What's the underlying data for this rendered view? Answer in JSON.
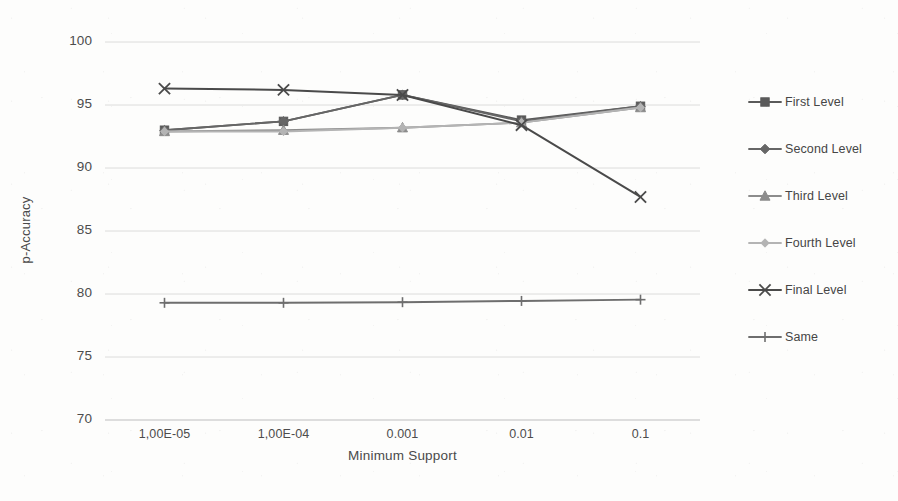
{
  "chart_data": {
    "type": "line",
    "title": "",
    "xlabel": "Minimum Support",
    "ylabel": "p-Accuracy",
    "categories": [
      "1,00E-05",
      "1,00E-04",
      "0.001",
      "0.01",
      "0.1"
    ],
    "ylim": [
      70,
      100
    ],
    "yticks": [
      70,
      75,
      80,
      85,
      90,
      95,
      100
    ],
    "grid": "horizontal",
    "legend_position": "right",
    "series": [
      {
        "name": "First Level",
        "marker": "square",
        "color": "#5a5a5a",
        "values": [
          93.0,
          93.7,
          95.8,
          93.8,
          94.9
        ]
      },
      {
        "name": "Second Level",
        "marker": "diamond",
        "color": "#666666",
        "values": [
          93.0,
          93.7,
          95.8,
          93.7,
          94.9
        ]
      },
      {
        "name": "Third Level",
        "marker": "triangle",
        "color": "#8c8c8c",
        "values": [
          92.9,
          93.0,
          93.2,
          93.6,
          94.8
        ]
      },
      {
        "name": "Fourth Level",
        "marker": "diamond-light",
        "color": "#b4b4b4",
        "values": [
          92.9,
          92.9,
          93.2,
          93.6,
          94.8
        ]
      },
      {
        "name": "Final Level",
        "marker": "x",
        "color": "#4a4a4a",
        "values": [
          96.3,
          96.2,
          95.8,
          93.4,
          87.7
        ]
      },
      {
        "name": "Same",
        "marker": "plus",
        "color": "#6e6e6e",
        "values": [
          79.3,
          79.3,
          79.35,
          79.45,
          79.55
        ]
      }
    ]
  },
  "legend": {
    "items": [
      {
        "label": "First Level"
      },
      {
        "label": "Second Level"
      },
      {
        "label": "Third Level"
      },
      {
        "label": "Fourth Level"
      },
      {
        "label": "Final Level"
      },
      {
        "label": "Same"
      }
    ]
  },
  "axes": {
    "y_title": "p-Accuracy",
    "x_title": "Minimum Support",
    "y_tick_labels": [
      "100",
      "95",
      "90",
      "85",
      "80",
      "75",
      "70"
    ],
    "x_tick_labels": [
      "1,00E-05",
      "1,00E-04",
      "0.001",
      "0.01",
      "0.1"
    ]
  },
  "colors": {
    "gridline": "#d8d8d8",
    "axis_line": "#bdbdbd",
    "text": "#4a4a4a"
  }
}
